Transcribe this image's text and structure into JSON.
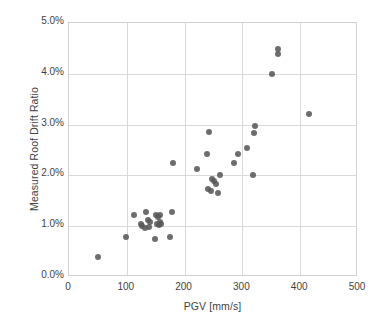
{
  "chart_data": {
    "type": "scatter",
    "title": "",
    "xlabel": "PGV [mm/s]",
    "ylabel": "Measured Roof Drift Ratio",
    "xlim": [
      0,
      500
    ],
    "ylim": [
      0,
      5
    ],
    "xticks": [
      0,
      100,
      200,
      300,
      400,
      500
    ],
    "xtick_labels": [
      "0",
      "100",
      "200",
      "300",
      "400",
      "500"
    ],
    "yticks": [
      0,
      1,
      2,
      3,
      4,
      5
    ],
    "ytick_labels": [
      "0.0%",
      "1.0%",
      "2.0%",
      "3.0%",
      "4.0%",
      "5.0%"
    ],
    "grid": true,
    "legend": "none",
    "marker_color": "#595959",
    "series": [
      {
        "name": "Measured buildings",
        "points": [
          [
            50,
            0.4
          ],
          [
            98,
            0.78
          ],
          [
            112,
            1.22
          ],
          [
            124,
            1.05
          ],
          [
            127,
            1.0
          ],
          [
            131,
            0.97
          ],
          [
            134,
            1.27
          ],
          [
            136,
            1.12
          ],
          [
            138,
            0.99
          ],
          [
            141,
            1.08
          ],
          [
            149,
            0.75
          ],
          [
            151,
            1.22
          ],
          [
            152,
            1.05
          ],
          [
            154,
            1.18
          ],
          [
            155,
            1.02
          ],
          [
            157,
            1.08
          ],
          [
            158,
            1.22
          ],
          [
            160,
            1.04
          ],
          [
            175,
            0.78
          ],
          [
            178,
            1.27
          ],
          [
            180,
            2.25
          ],
          [
            222,
            2.12
          ],
          [
            238,
            2.43
          ],
          [
            240,
            1.73
          ],
          [
            243,
            2.85
          ],
          [
            246,
            1.7
          ],
          [
            248,
            1.93
          ],
          [
            250,
            1.88
          ],
          [
            255,
            1.84
          ],
          [
            258,
            1.66
          ],
          [
            261,
            2.0
          ],
          [
            285,
            2.25
          ],
          [
            292,
            2.42
          ],
          [
            308,
            2.53
          ],
          [
            318,
            2.0
          ],
          [
            320,
            2.84
          ],
          [
            321,
            2.98
          ],
          [
            352,
            4.0
          ],
          [
            361,
            4.38
          ],
          [
            362,
            4.49
          ],
          [
            415,
            3.2
          ]
        ]
      }
    ]
  }
}
